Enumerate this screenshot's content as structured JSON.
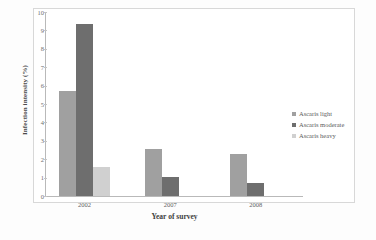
{
  "chart_data": {
    "type": "bar",
    "title": "",
    "xlabel": "Year of survey",
    "ylabel": "Infection intensity (%)",
    "categories": [
      "2002",
      "2007",
      "2008"
    ],
    "series": [
      {
        "name": "Ascaris light",
        "values": [
          5.7,
          2.55,
          2.3
        ],
        "color": "#a0a0a0"
      },
      {
        "name": "Ascaris moderate",
        "values": [
          9.35,
          1.05,
          0.7
        ],
        "color": "#6e6e6e"
      },
      {
        "name": "Ascaris heavy",
        "values": [
          1.55,
          0,
          0
        ],
        "color": "#d0d0d0"
      }
    ],
    "ylim": [
      0,
      10
    ],
    "yticks": [
      "0",
      "1",
      "2",
      "3",
      "4",
      "5",
      "6",
      "7",
      "8",
      "9",
      "10"
    ],
    "grid": false,
    "legend_position": "right"
  },
  "legend": {
    "items": [
      {
        "label": "Ascaris light"
      },
      {
        "label": "Ascaris moderate"
      },
      {
        "label": "Ascaris heavy"
      }
    ]
  }
}
